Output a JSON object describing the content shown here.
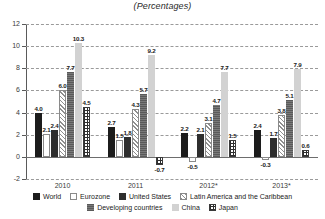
{
  "chart_data": {
    "type": "bar",
    "title": "(Percentages)",
    "subtitle": "",
    "xlabel": "",
    "ylabel": "",
    "ylim": [
      -2,
      12
    ],
    "yticks": [
      -2,
      0,
      2,
      4,
      6,
      8,
      10,
      12
    ],
    "ytick_labels": [
      "-2",
      "0",
      "2",
      "4",
      "6",
      "8",
      "10",
      "12"
    ],
    "grid": true,
    "grid_style": "dashed-horizontal",
    "legend_position": "bottom",
    "categories": [
      "2010",
      "2011",
      "2012*",
      "2013*"
    ],
    "series": [
      {
        "name": "World",
        "pattern": "solid-black",
        "values": [
          4.0,
          2.7,
          2.2,
          2.4
        ]
      },
      {
        "name": "Eurozone",
        "pattern": "dotted",
        "values": [
          2.1,
          1.5,
          -0.5,
          -0.3
        ]
      },
      {
        "name": "United States",
        "pattern": "solid-dark",
        "values": [
          2.4,
          1.8,
          2.1,
          1.7
        ]
      },
      {
        "name": "Latin America and the Caribbean",
        "pattern": "diagonal-hatch",
        "values": [
          6.0,
          4.3,
          3.1,
          3.8
        ]
      },
      {
        "name": "Developing countries",
        "pattern": "gray-lines",
        "values": [
          7.7,
          5.7,
          4.7,
          5.1
        ]
      },
      {
        "name": "China",
        "pattern": "solid-light",
        "values": [
          10.3,
          9.2,
          7.7,
          7.9
        ]
      },
      {
        "name": "Japan",
        "pattern": "grid-hatch",
        "values": [
          4.5,
          -0.7,
          1.5,
          0.6
        ]
      }
    ],
    "value_labels": {
      "2010": [
        "4.0",
        "2.1",
        "2.4",
        "6.0",
        "7.7",
        "10.3",
        "4.5"
      ],
      "2011": [
        "2.7",
        "1.5",
        "1.8",
        "4.3",
        "5.7",
        "9.2",
        "-0.7"
      ],
      "2012*": [
        "2.2",
        "-0.5",
        "2.1",
        "3.1",
        "4.7",
        "7.7",
        "1.5"
      ],
      "2013*": [
        "2.4",
        "-0.3",
        "1.7",
        "3.8",
        "5.1",
        "7.9",
        "0.6"
      ]
    }
  },
  "legend": {
    "row1": [
      "World",
      "Eurozone",
      "United States",
      "Latin America and the Caribbean"
    ],
    "row2": [
      "Developing countries",
      "China",
      "Japan"
    ]
  },
  "colors": {
    "world": "#1c1c1c",
    "eurozone": "#ffffff",
    "united_states": "#2e2e2e",
    "latin_america": "#ffffff",
    "developing": "#6a6a6a",
    "china": "#d2d2d2",
    "japan": "#ffffff",
    "grid": "#9a9a9a",
    "axis": "#5a5a5a"
  }
}
